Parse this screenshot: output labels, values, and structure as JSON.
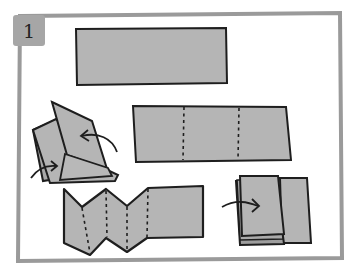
{
  "step": {
    "number": "1"
  },
  "colors": {
    "paper_fill": "#b5b5b5",
    "outline": "#1e1e1e",
    "frame": "#9a9a9a",
    "badge": "#a6a6a6",
    "background": "#ffffff"
  },
  "illustrations": [
    {
      "id": "flat-strip",
      "description": "Long rectangular paper strip"
    },
    {
      "id": "strip-with-fold-lines",
      "description": "Paper strip with two dashed vertical fold lines"
    },
    {
      "id": "zigzag-accordion",
      "description": "Paper strip folded accordion style with dashed fold lines"
    },
    {
      "id": "stacked-pages",
      "description": "Folded stack of pages with arrow indicating folding onto base"
    },
    {
      "id": "folded-booklet",
      "description": "Folded booklet with two curved arrows indicating folding direction"
    }
  ]
}
